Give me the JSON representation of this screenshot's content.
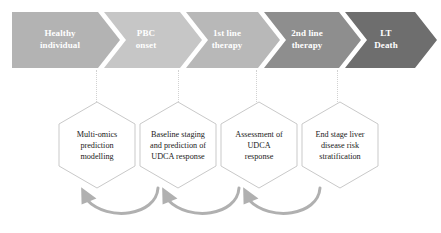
{
  "diagram": {
    "timeline": {
      "name": "disease-course-chevrons",
      "stages": [
        {
          "id": "healthy-individual",
          "label": "Healthy\nindividual",
          "color": "#b3b3b3",
          "text_color": "#ffffff"
        },
        {
          "id": "pbc-onset",
          "label": "PBC\nonset",
          "color": "#c6c6c6",
          "text_color": "#ffffff"
        },
        {
          "id": "first-line-therapy",
          "label": "1st line\ntherapy",
          "color": "#b8b8b8",
          "text_color": "#ffffff"
        },
        {
          "id": "second-line-therapy",
          "label": "2nd line\ntherapy",
          "color": "#8e8e8e",
          "text_color": "#ffffff"
        },
        {
          "id": "lt-death",
          "label": "LT\nDeath",
          "color": "#6e6e6e",
          "text_color": "#ffffff"
        }
      ]
    },
    "hexagons": {
      "name": "analysis-steps",
      "outline_color": "#c9c9c9",
      "fill_color": "#ffffff",
      "items": [
        {
          "id": "multi-omics-prediction-modelling",
          "label": "Multi-omics\nprediction\nmodelling"
        },
        {
          "id": "baseline-staging-udca-prediction",
          "label": "Baseline staging\nand prediction of\nUDCA response"
        },
        {
          "id": "assessment-of-udca-response",
          "label": "Assessment of\nUDCA\nresponse"
        },
        {
          "id": "end-stage-liver-disease-risk",
          "label": "End stage liver\ndisease risk\nstratification"
        }
      ]
    },
    "feedback_arrows": {
      "name": "feedback-loop-arrows",
      "color": "#b0b0b0",
      "count": 3,
      "direction": "right-to-left",
      "items": [
        {
          "id": "feedback-arrow-2-to-1",
          "from": "baseline-staging-udca-prediction",
          "to": "multi-omics-prediction-modelling"
        },
        {
          "id": "feedback-arrow-3-to-2",
          "from": "assessment-of-udca-response",
          "to": "baseline-staging-udca-prediction"
        },
        {
          "id": "feedback-arrow-4-to-3",
          "from": "end-stage-liver-disease-risk",
          "to": "assessment-of-udca-response"
        }
      ]
    },
    "connectors": {
      "name": "stage-to-step-connectors",
      "style": "dotted",
      "color": "#d2d2d2"
    }
  }
}
